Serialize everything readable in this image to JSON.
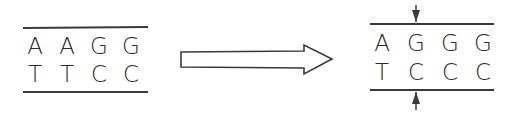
{
  "diagram": {
    "before": {
      "top_strand": [
        "A",
        "A",
        "G",
        "G"
      ],
      "bottom_strand": [
        "T",
        "T",
        "C",
        "C"
      ]
    },
    "after": {
      "top_strand": [
        "A",
        "G",
        "G",
        "G"
      ],
      "bottom_strand": [
        "T",
        "C",
        "C",
        "C"
      ],
      "marked_position": 2
    },
    "transition_arrow": "hollow-right-arrow",
    "markers": [
      "down-arrow-marker",
      "up-arrow-marker"
    ],
    "colors": {
      "ink": "#3a3a3a",
      "background": "#ffffff"
    }
  }
}
